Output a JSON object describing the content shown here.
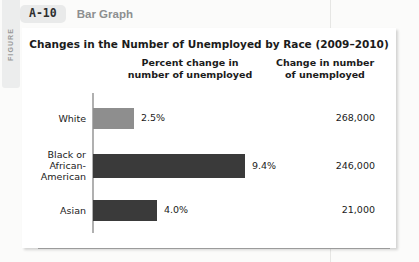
{
  "figure": {
    "side_tab_label": "FIGURE",
    "number": "A-10",
    "kind": "Bar Graph"
  },
  "chart_data": {
    "type": "bar",
    "orientation": "horizontal",
    "title": "Changes in the Number of Unemployed by Race (2009–2010)",
    "xlabel": "",
    "ylabel": "",
    "grid": false,
    "legend": "none",
    "column_headers": [
      "Percent change in\nnumber of unemployed",
      "Change in number\nof unemployed"
    ],
    "column_header_pct_line1": "Percent change in",
    "column_header_pct_line2": "number of unemployed",
    "column_header_count_line1": "Change in number",
    "column_header_count_line2": "of unemployed",
    "categories": [
      "White",
      "Black or African-American",
      "Asian"
    ],
    "values": [
      2.5,
      9.4,
      4.0
    ],
    "value_labels": [
      "2.5%",
      "4.0%",
      "9.4%"
    ],
    "xlim": [
      0,
      10
    ],
    "series": [
      {
        "name": "Percent change in number of unemployed",
        "unit": "%",
        "values": [
          2.5,
          9.4,
          4.0
        ]
      },
      {
        "name": "Change in number of unemployed",
        "unit": "people",
        "values": [
          268000,
          246000,
          21000
        ]
      }
    ],
    "rows": [
      {
        "category_line1": "White",
        "category_line2": "",
        "category_line3": "",
        "percent": 2.5,
        "percent_label": "2.5%",
        "count_label": "268,000",
        "bar_width_px": 41,
        "bar_color": "#8e8e8e"
      },
      {
        "category_line1": "Black or",
        "category_line2": "African-",
        "category_line3": "American",
        "percent": 9.4,
        "percent_label": "9.4%",
        "count_label": "246,000",
        "bar_width_px": 152,
        "bar_color": "#3a3a3a"
      },
      {
        "category_line1": "Asian",
        "category_line2": "",
        "category_line3": "",
        "percent": 4.0,
        "percent_label": "4.0%",
        "count_label": "21,000",
        "bar_width_px": 64,
        "bar_color": "#3a3a3a"
      }
    ],
    "colors": {
      "bar_light": "#8e8e8e",
      "bar_dark": "#3a3a3a",
      "axis": "#b0b0b0",
      "text": "#1b1b1b"
    }
  }
}
